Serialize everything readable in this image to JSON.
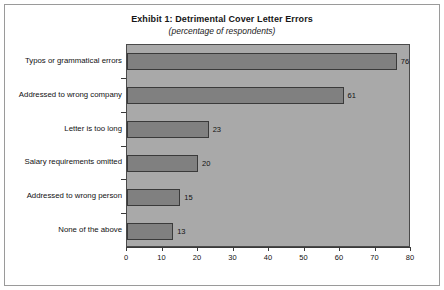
{
  "chart_data": {
    "type": "bar",
    "orientation": "horizontal",
    "title": "Exhibit 1: Detrimental Cover Letter Errors",
    "subtitle": "(percentage of respondents)",
    "xlabel": "",
    "ylabel": "",
    "categories": [
      "Typos or grammatical errors",
      "Addressed to wrong company",
      "Letter is too long",
      "Salary requirements omitted",
      "Addressed to wrong person",
      "None of the above"
    ],
    "values": [
      76,
      61,
      23,
      20,
      15,
      13
    ],
    "data_labels": [
      "76",
      "61",
      "23",
      "20",
      "15",
      "13"
    ],
    "xlim": [
      0,
      80
    ],
    "xticks": [
      0,
      10,
      20,
      30,
      40,
      50,
      60,
      70,
      80
    ],
    "xtick_labels": [
      "0",
      "10",
      "20",
      "30",
      "40",
      "50",
      "60",
      "70",
      "80"
    ],
    "grid": false,
    "legend": false,
    "colors": {
      "plot_background": "#a9a9a9",
      "bar_fill": "#808080",
      "bar_border": "#3a3a3a",
      "axis": "#3a3a3a",
      "text": "#111111",
      "frame": "#9a9a9a",
      "page_background": "#ffffff"
    }
  }
}
